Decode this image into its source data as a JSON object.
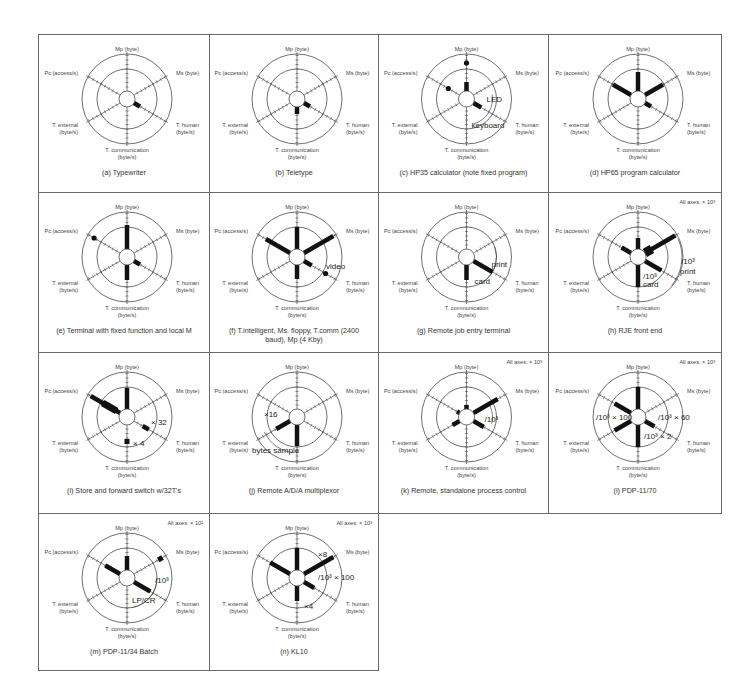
{
  "figure": {
    "axes": {
      "mp": "Mp (byte)",
      "ms": "Ms (byte)",
      "pc": "Pc (access/s)",
      "t_external": [
        "T. external",
        "(byte/s)"
      ],
      "t_human": [
        "T. human",
        "(byte/s)"
      ],
      "t_communication": [
        "T. communication",
        "(byte/s)"
      ]
    },
    "panels": [
      {
        "id": "a",
        "caption": "(a)  Typewriter",
        "scale_note": "",
        "bars": [
          {
            "axis": "t_human",
            "r0": 8,
            "r1": 15,
            "w": 4.5
          }
        ],
        "dots": [],
        "annotations": []
      },
      {
        "id": "b",
        "caption": "(b)  Teletype",
        "scale_note": "",
        "bars": [
          {
            "axis": "t_human",
            "r0": 8,
            "r1": 15,
            "w": 4.5
          },
          {
            "axis": "t_communication",
            "r0": 8,
            "r1": 15,
            "w": 4.5
          }
        ],
        "dots": [],
        "annotations": []
      },
      {
        "id": "c",
        "caption": "(c)  HP35 calculator (note fixed program)",
        "scale_note": "",
        "bars": [
          {
            "axis": "mp",
            "r0": 8,
            "r1": 17,
            "w": 4.5
          },
          {
            "axis": "t_human",
            "r0": 8,
            "r1": 17,
            "w": 4.5
          }
        ],
        "dots": [
          {
            "axis": "mp",
            "r": 36
          },
          {
            "axis": "pc",
            "r": 21
          }
        ],
        "annotations": [
          {
            "text": "LED",
            "dx": 20,
            "dy": 3,
            "size": "ann"
          },
          {
            "text": "keyboard",
            "dx": 5,
            "dy": 29,
            "size": "ann"
          }
        ],
        "arcs": [
          {
            "r": 26,
            "a0": -10,
            "a1": 75
          }
        ]
      },
      {
        "id": "d",
        "caption": "(d)  HP65 program calculator",
        "scale_note": "",
        "bars": [
          {
            "axis": "mp",
            "r0": 8,
            "r1": 27,
            "w": 4.5
          },
          {
            "axis": "ms",
            "r0": 8,
            "r1": 29,
            "w": 4.5
          },
          {
            "axis": "pc",
            "r0": 8,
            "r1": 29,
            "w": 4.5
          },
          {
            "axis": "t_human",
            "r0": 8,
            "r1": 15,
            "w": 4.5
          }
        ],
        "dots": [],
        "annotations": []
      },
      {
        "id": "e",
        "caption": "(e)  Terminal with fixed function and local M",
        "scale_note": "",
        "bars": [
          {
            "axis": "mp",
            "r0": 8,
            "r1": 32,
            "w": 4.5
          },
          {
            "axis": "t_human",
            "r0": 8,
            "r1": 15,
            "w": 4.5
          },
          {
            "axis": "t_communication",
            "r0": 8,
            "r1": 23,
            "w": 4.5
          }
        ],
        "dots": [
          {
            "axis": "pc",
            "r": 38
          }
        ],
        "annotations": []
      },
      {
        "id": "f",
        "caption": "(f)  T.intelligent, Ms. floppy, T.comm (2400 baud), Mp (4 Kby)",
        "scale_note": "",
        "bars": [
          {
            "axis": "mp",
            "r0": 8,
            "r1": 30,
            "w": 4.5
          },
          {
            "axis": "ms",
            "r0": 8,
            "r1": 42,
            "w": 4.5
          },
          {
            "axis": "pc",
            "r0": 8,
            "r1": 36,
            "w": 4.5
          },
          {
            "axis": "t_human",
            "r0": 8,
            "r1": 17,
            "w": 4.5
          },
          {
            "axis": "t_communication",
            "r0": 8,
            "r1": 22,
            "w": 4.5
          }
        ],
        "dots": [
          {
            "axis": "t_human",
            "r": 33
          }
        ],
        "annotations": [
          {
            "text": "video",
            "dx": 29,
            "dy": 12,
            "size": "ann"
          }
        ]
      },
      {
        "id": "g",
        "caption": "(g)  Remote job entry terminal",
        "scale_note": "",
        "bars": [
          {
            "axis": "t_human",
            "r0": 8,
            "r1": 30,
            "w": 4.5
          },
          {
            "axis": "t_communication",
            "r0": 8,
            "r1": 23,
            "w": 4.5
          }
        ],
        "dots": [],
        "annotations": [
          {
            "text": "print",
            "dx": 25,
            "dy": 10,
            "size": "ann"
          },
          {
            "text": "card",
            "dx": 8,
            "dy": 27,
            "size": "ann"
          }
        ],
        "arcs": [
          {
            "r": 30,
            "a0": -20,
            "a1": 50
          }
        ]
      },
      {
        "id": "h",
        "caption": "(h)  RJE front end",
        "scale_note": "All axes:  × 10³",
        "bars": [
          {
            "axis": "mp",
            "r0": 8,
            "r1": 19,
            "w": 4.5
          },
          {
            "axis": "ms",
            "r0": 8,
            "r1": 43,
            "w": 4.5
          },
          {
            "axis": "ms",
            "r0": 8,
            "r1": 16,
            "w": 9
          },
          {
            "axis": "pc",
            "r0": 8,
            "r1": 19,
            "w": 4.5
          },
          {
            "axis": "t_human",
            "r0": 8,
            "r1": 27,
            "w": 4.5
          },
          {
            "axis": "t_communication",
            "r0": 8,
            "r1": 30,
            "w": 4.5
          }
        ],
        "dots": [],
        "annotations": [
          {
            "text": "/10³",
            "dx": 43,
            "dy": 7,
            "size": "ann"
          },
          {
            "text": "print",
            "dx": 42,
            "dy": 17,
            "size": "ann"
          },
          {
            "text": "/10³",
            "dx": 5,
            "dy": 22,
            "size": "ann"
          },
          {
            "text": "card",
            "dx": 5,
            "dy": 30,
            "size": "ann"
          }
        ],
        "arcs": [
          {
            "r": 44,
            "a0": -25,
            "a1": 40
          }
        ]
      },
      {
        "id": "i",
        "caption": "(i)  Store and forward switch w/32T's",
        "scale_note": "",
        "bars": [
          {
            "axis": "mp",
            "r0": 8,
            "r1": 29,
            "w": 4.5
          },
          {
            "axis": "pc",
            "r0": 8,
            "r1": 42,
            "w": 4.5
          },
          {
            "axis": "pc",
            "r0": 12,
            "r1": 28,
            "w": 7
          },
          {
            "axis": "t_human",
            "r0": 18,
            "r1": 25,
            "w": 4.5
          },
          {
            "axis": "t_communication",
            "r0": 22,
            "r1": 27,
            "w": 5
          }
        ],
        "dots": [],
        "annotations": [
          {
            "text": "× 32",
            "dx": 24,
            "dy": 8,
            "size": "ann"
          },
          {
            "text": "× 4",
            "dx": 6,
            "dy": 29,
            "size": "ann"
          }
        ]
      },
      {
        "id": "j",
        "caption": "(j)  Remote A/D/A multiplexor",
        "scale_note": "",
        "bars": [
          {
            "axis": "t_external",
            "r0": 8,
            "r1": 24,
            "w": 4.5
          },
          {
            "axis": "t_communication",
            "r0": 8,
            "r1": 29,
            "w": 4.5
          }
        ],
        "dots": [],
        "annotations": [
          {
            "text": "×16",
            "dx": -33,
            "dy": 0,
            "size": "ann"
          },
          {
            "text": "bytes sample",
            "dx": -45,
            "dy": 36,
            "size": "ann"
          }
        ],
        "arcs": [
          {
            "r": 36,
            "a0": 95,
            "a1": 155
          }
        ]
      },
      {
        "id": "k",
        "caption": "(k)  Remote, standalone process control",
        "scale_note": "All axes:  × 10³",
        "bars": [
          {
            "axis": "mp",
            "r0": 8,
            "r1": 12,
            "w": 4.5
          },
          {
            "axis": "ms",
            "r0": 8,
            "r1": 36,
            "w": 4.5
          },
          {
            "axis": "pc",
            "r0": 8,
            "r1": 11,
            "w": 4.5
          },
          {
            "axis": "t_external",
            "r0": 8,
            "r1": 16,
            "w": 4.5
          },
          {
            "axis": "t_human",
            "r0": 8,
            "r1": 20,
            "w": 4.5
          }
        ],
        "dots": [],
        "annotations": [
          {
            "text": "/10³",
            "dx": 18,
            "dy": 5,
            "size": "ann"
          }
        ],
        "arcs": [
          {
            "r": 26,
            "a0": -25,
            "a1": 15
          }
        ]
      },
      {
        "id": "l",
        "caption": "(l)  PDP-11/70",
        "scale_note": "All axes:  × 10³",
        "bars": [
          {
            "axis": "mp",
            "r0": 8,
            "r1": 30,
            "w": 4.5
          },
          {
            "axis": "pc",
            "r0": 8,
            "r1": 27,
            "w": 4.5
          },
          {
            "axis": "t_external",
            "r0": 8,
            "r1": 27,
            "w": 4.5
          },
          {
            "axis": "t_human",
            "r0": 8,
            "r1": 19,
            "w": 4.5
          },
          {
            "axis": "t_communication",
            "r0": 8,
            "r1": 30,
            "w": 4.5
          }
        ],
        "dots": [],
        "annotations": [
          {
            "text": "/10³ × 100",
            "dx": -42,
            "dy": 3,
            "size": "ann"
          },
          {
            "text": "/10³ × 60",
            "dx": 20,
            "dy": 3,
            "size": "ann"
          },
          {
            "text": "/10³ × 2",
            "dx": 6,
            "dy": 22,
            "size": "ann"
          }
        ]
      },
      {
        "id": "m",
        "caption": "(m)  PDP-11/34 Batch",
        "scale_note": "All axes:  × 10²",
        "bars": [
          {
            "axis": "mp",
            "r0": 8,
            "r1": 22,
            "w": 4.5
          },
          {
            "axis": "pc",
            "r0": 8,
            "r1": 25,
            "w": 4.5
          },
          {
            "axis": "ms",
            "r0": 36,
            "r1": 41,
            "w": 5
          },
          {
            "axis": "t_human",
            "r0": 8,
            "r1": 27,
            "w": 4.5
          }
        ],
        "dots": [],
        "annotations": [
          {
            "text": "/10³",
            "dx": 28,
            "dy": 5,
            "size": "ann"
          },
          {
            "text": "LP/CR",
            "dx": 5,
            "dy": 25,
            "size": "ann"
          }
        ],
        "arcs": [
          {
            "r": 30,
            "a0": 0,
            "a1": 80
          }
        ]
      },
      {
        "id": "n",
        "caption": "(n)  KL10",
        "scale_note": "All axes:  × 10³",
        "bars": [
          {
            "axis": "mp",
            "r0": 8,
            "r1": 30,
            "w": 4.5
          },
          {
            "axis": "ms",
            "r0": 8,
            "r1": 42,
            "w": 4.5
          },
          {
            "axis": "pc",
            "r0": 8,
            "r1": 31,
            "w": 4.5
          },
          {
            "axis": "t_human",
            "r0": 8,
            "r1": 20,
            "w": 4.5
          },
          {
            "axis": "t_communication",
            "r0": 8,
            "r1": 23,
            "w": 4.5
          }
        ],
        "dots": [],
        "annotations": [
          {
            "text": "×8",
            "dx": 21,
            "dy": -21,
            "size": "ann"
          },
          {
            "text": "/10³ × 100",
            "dx": 21,
            "dy": 2,
            "size": "ann"
          },
          {
            "text": "×4",
            "dx": 7,
            "dy": 31,
            "size": "ann"
          }
        ]
      }
    ]
  },
  "colors": {
    "ink": "#111111",
    "line": "#4a4a4a",
    "border": "#6a6a6a",
    "text": "#333333"
  }
}
